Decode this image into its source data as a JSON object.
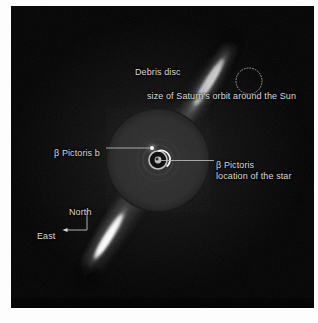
{
  "figure": {
    "background_color": "#030303",
    "page_color": "#ffffff",
    "text_color": "#d9d9d9"
  },
  "annotations": {
    "debris_disc": "Debris disc",
    "saturn_orbit": "size of Saturn's orbit around the Sun",
    "planet": "β Pictoris b",
    "star_line1": "β Pictoris",
    "star_line2": "location of the star",
    "north": "North",
    "east": "East"
  },
  "markers": {
    "planet_dot": {
      "x": 141,
      "y": 142,
      "r": 2.0,
      "color": "#ffffff"
    },
    "star_center": {
      "x": 147,
      "y": 154,
      "color": "#c8c8c8"
    },
    "coronagraph_mask": {
      "x": 147,
      "y": 154,
      "r": 52,
      "color": "#2b2b2b"
    },
    "saturn_orbit_circle": {
      "x": 238,
      "y": 75,
      "r": 13,
      "style": "dotted",
      "color": "#9a9a9a"
    }
  },
  "leader_lines": {
    "planet_leader": {
      "x1": 95,
      "y1": 142,
      "x2": 139,
      "y2": 142,
      "color": "#b4b4b4"
    },
    "star_leader": {
      "x1": 150,
      "y1": 154,
      "x2": 203,
      "y2": 154,
      "color": "#b4b4b4"
    }
  },
  "compass": {
    "origin": {
      "x": 76,
      "y": 224
    },
    "north_tip": {
      "x": 76,
      "y": 205
    },
    "east_tip": {
      "x": 52,
      "y": 224
    },
    "color": "#c4c4c4"
  },
  "disc_geometry": {
    "position_angle_deg": 30,
    "northeast_extension": {
      "label": "NE debris disc extension",
      "bright": true
    },
    "southwest_extension": {
      "label": "SW debris disc extension",
      "bright": true
    }
  }
}
